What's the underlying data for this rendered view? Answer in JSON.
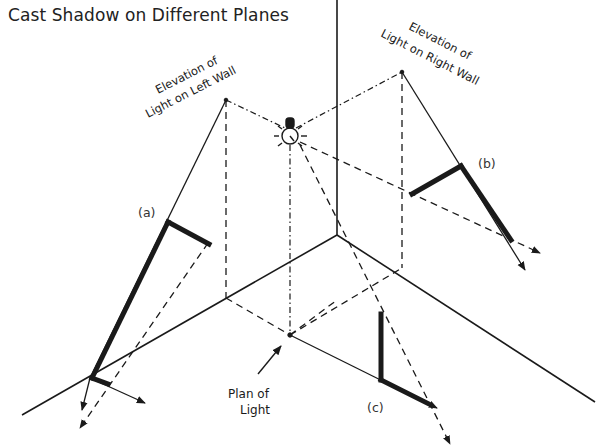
{
  "title": "Cast Shadow on Different Planes",
  "colors": {
    "ink": "#1a1a1a",
    "background": "#ffffff"
  },
  "labels": {
    "left_wall_line1": "Elevation of",
    "left_wall_line2": "Light on Left Wall",
    "right_wall_line1": "Elevation of",
    "right_wall_line2": "Light on Right Wall",
    "plan_line1": "Plan of",
    "plan_line2": "Light",
    "a": "(a)",
    "b": "(b)",
    "c": "(c)"
  },
  "geometry": {
    "corner_vertical": [
      [
        337,
        0
      ],
      [
        337,
        235
      ]
    ],
    "floor_left_edge": [
      [
        337,
        235
      ],
      [
        25,
        415
      ]
    ],
    "floor_right_edge": [
      [
        337,
        235
      ],
      [
        590,
        400
      ]
    ],
    "light_point": [
      290,
      132
    ],
    "plan_point": [
      290,
      335
    ],
    "left_elev_point": [
      226,
      100
    ],
    "right_elev_point": [
      402,
      72
    ]
  },
  "icons": {
    "light": "light-bulb-icon"
  }
}
